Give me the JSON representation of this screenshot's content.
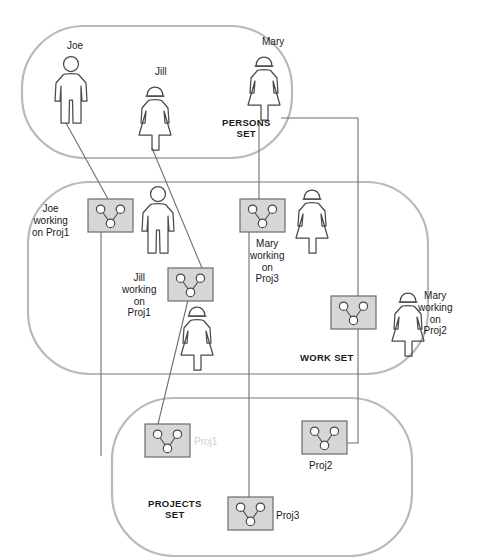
{
  "diagram": {
    "colors": {
      "set_outline": "#b9b9b9",
      "connector": "#6e6e6e",
      "figure_outline": "#4a4a4a",
      "project_box_fill": "#d6d6d6",
      "project_box_stroke": "#6b6b6b",
      "node_fill": "#ffffff",
      "text": "#1a1a1a",
      "faded_text": "#cfcfcf"
    }
  },
  "sets": [
    {
      "id": "persons",
      "label": "PERSONS\nSET",
      "label_x": 222,
      "label_y": 117,
      "x": 22,
      "y": 26,
      "w": 270,
      "h": 132,
      "r": 62
    },
    {
      "id": "work",
      "label": "WORK SET",
      "label_x": 300,
      "label_y": 352,
      "x": 28,
      "y": 182,
      "w": 400,
      "h": 192,
      "r": 62
    },
    {
      "id": "projects",
      "label": "PROJECTS\nSET",
      "label_x": 148,
      "label_y": 498,
      "x": 112,
      "y": 398,
      "w": 300,
      "h": 158,
      "r": 62
    }
  ],
  "persons": [
    {
      "id": "joe",
      "name": "Joe",
      "gender": "male",
      "x": 51,
      "y": 56,
      "label_x": 67,
      "label_y": 40
    },
    {
      "id": "jill",
      "name": "Jill",
      "gender": "female",
      "x": 135,
      "y": 82,
      "label_x": 155,
      "label_y": 66
    },
    {
      "id": "mary",
      "name": "Mary",
      "gender": "female",
      "x": 244,
      "y": 52,
      "label_x": 262,
      "label_y": 36
    }
  ],
  "work_items": [
    {
      "id": "joe-proj1",
      "label": "Joe\nworking\non Proj1",
      "box_x": 88,
      "box_y": 199,
      "figure_gender": "male",
      "figure_x": 138,
      "figure_y": 186,
      "label_x": 32,
      "label_y": 203,
      "label_align": "center"
    },
    {
      "id": "jill-proj1",
      "label": "Jill\nworking\non\nProj1",
      "box_x": 168,
      "box_y": 268,
      "figure_gender": "female",
      "figure_x": 177,
      "figure_y": 302,
      "label_x": 122,
      "label_y": 272,
      "label_align": "center"
    },
    {
      "id": "mary-proj3",
      "label": "Mary\nworking\non\nProj3",
      "box_x": 240,
      "box_y": 199,
      "figure_gender": "female",
      "figure_x": 292,
      "figure_y": 185,
      "label_x": 250,
      "label_y": 238,
      "label_align": "center"
    },
    {
      "id": "mary-proj2",
      "label": "Mary\nworking\non\nProj2",
      "box_x": 331,
      "box_y": 296,
      "figure_gender": "female",
      "figure_x": 388,
      "figure_y": 288,
      "label_x": 418,
      "label_y": 290,
      "label_align": "center"
    }
  ],
  "projects": [
    {
      "id": "proj1",
      "label": "Proj1",
      "box_x": 145,
      "box_y": 424,
      "label_x": 194,
      "label_y": 436,
      "faded": true
    },
    {
      "id": "proj2",
      "label": "Proj2",
      "box_x": 302,
      "box_y": 421,
      "label_x": 309,
      "label_y": 460,
      "faded": false
    },
    {
      "id": "proj3",
      "label": "Proj3",
      "box_x": 228,
      "box_y": 497,
      "label_x": 276,
      "label_y": 510,
      "faded": false
    }
  ],
  "connectors": [
    {
      "id": "joe-to-work",
      "from": "person-joe",
      "to": "work-joe-proj1",
      "path": "M 66 123 L 108 199"
    },
    {
      "id": "jill-to-work",
      "from": "person-jill",
      "to": "work-jill-proj1",
      "path": "M 152 148 L 202 268"
    },
    {
      "id": "mary-to-work-proj3",
      "from": "person-mary",
      "to": "work-mary-proj3",
      "path": "M 259 121 L 259 199"
    },
    {
      "id": "mary-to-work-proj2",
      "from": "person-mary",
      "to": "work-mary-proj2",
      "path": "M 281 118 L 358 118 L 358 296"
    },
    {
      "id": "workjoe-down",
      "from": "work-joe-proj1",
      "to": "projects-area",
      "path": "M 101 232 L 101 456"
    },
    {
      "id": "workjill-to-proj1",
      "from": "work-jill-proj1",
      "to": "project-proj1",
      "path": "M 188 300 L 158 424"
    },
    {
      "id": "workmary3-to-proj3",
      "from": "work-mary-proj3",
      "to": "project-proj3",
      "path": "M 249 232 L 249 497"
    },
    {
      "id": "workmary2-to-proj2",
      "from": "work-mary-proj2",
      "to": "project-proj2",
      "path": "M 358 329 L 358 443 L 347 443"
    }
  ],
  "geometry": {
    "project_box_w": 45,
    "project_box_h": 33,
    "figure_w": 40,
    "figure_h": 68
  }
}
